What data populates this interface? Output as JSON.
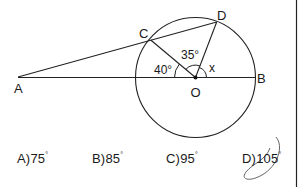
{
  "figure": {
    "points": {
      "A": {
        "label": "A",
        "x": 18,
        "y": 77
      },
      "B": {
        "label": "B",
        "x": 255,
        "y": 77
      },
      "C": {
        "label": "C",
        "x": 150.7,
        "y": 40
      },
      "D": {
        "label": "D",
        "x": 216.7,
        "y": 22
      },
      "O": {
        "label": "O",
        "x": 195.5,
        "y": 77.5
      }
    },
    "circle": {
      "cx": 195.5,
      "cy": 77.5,
      "r": 60
    },
    "angles": {
      "AOC": "40°",
      "COD": "35°",
      "DOB": "x"
    }
  },
  "answers": [
    {
      "letter": "A)",
      "value": "75",
      "unit": "°"
    },
    {
      "letter": "B)",
      "value": "85",
      "unit": "°"
    },
    {
      "letter": "C)",
      "value": "95",
      "unit": "°"
    },
    {
      "letter": "D)",
      "value": "105",
      "unit": "°",
      "marked": true
    }
  ],
  "colors": {
    "ink": "#1a1a1a",
    "pencil": "#555555"
  }
}
